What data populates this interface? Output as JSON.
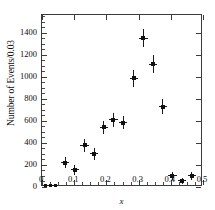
{
  "chart_data": {
    "type": "scatter",
    "title": "",
    "xlabel": "x",
    "ylabel": "Number of Events/0.03",
    "xlim": [
      0,
      0.5
    ],
    "ylim": [
      0,
      1560
    ],
    "grid": false,
    "legend": "none",
    "xticks": [
      "0",
      "0.1",
      "0.2",
      "0.3",
      "0.4",
      "0.5"
    ],
    "xtick_values": [
      0,
      0.1,
      0.2,
      0.3,
      0.4,
      0.5
    ],
    "yticks": [
      "0",
      "200",
      "400",
      "600",
      "800",
      "1000",
      "1200",
      "1400"
    ],
    "ytick_values": [
      0,
      200,
      400,
      600,
      800,
      1000,
      1200,
      1400
    ],
    "x": [
      0.012,
      0.027,
      0.042,
      0.072,
      0.102,
      0.132,
      0.162,
      0.192,
      0.222,
      0.252,
      0.285,
      0.315,
      0.345,
      0.375,
      0.405,
      0.435,
      0.465
    ],
    "values": [
      18,
      12,
      10,
      222,
      155,
      378,
      300,
      540,
      608,
      585,
      985,
      1350,
      1115,
      730,
      100,
      55,
      100
    ],
    "yerr": [
      12,
      10,
      10,
      48,
      45,
      58,
      52,
      60,
      62,
      62,
      78,
      80,
      82,
      68,
      34,
      28,
      34
    ],
    "xerr": [
      0.009,
      0.009,
      0.009,
      0.013,
      0.013,
      0.013,
      0.013,
      0.013,
      0.013,
      0.013,
      0.013,
      0.013,
      0.013,
      0.013,
      0.013,
      0.013,
      0.013
    ],
    "marker": "filled-square",
    "marker_color": "#111111",
    "errorbar_color": "#1a1a1a",
    "frame_color": "#3a3a3a",
    "background": "#ffffff"
  }
}
